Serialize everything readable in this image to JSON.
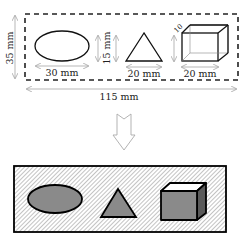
{
  "top_panel": {
    "overall_width_label": "115 mm",
    "overall_height_label": "35 mm",
    "ellipse_width_label": "30 mm",
    "shape_height_label": "15 mm",
    "triangle_width_label": "20 mm",
    "box_width_label": "20 mm",
    "box_depth_label": "10"
  },
  "arrow": {
    "direction": "down"
  },
  "bottom_panel": {
    "shapes": [
      "ellipse",
      "triangle",
      "box"
    ],
    "colors": {
      "shape_fill": "#8a8a8a",
      "box_top": "#ffffff",
      "box_side": "#5a5a5a",
      "hatch": "#888888",
      "outline": "#000000"
    }
  }
}
